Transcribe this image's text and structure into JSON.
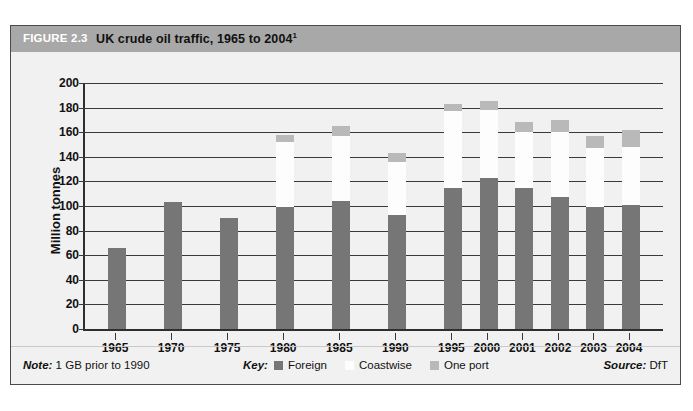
{
  "figure": {
    "number_label": "FIGURE 2.3",
    "title": "UK crude oil traffic, 1965 to 2004",
    "title_superscript": "1"
  },
  "footer": {
    "note_label": "Note:",
    "note_text": "1 GB prior to 1990",
    "key_label": "Key:",
    "source_label": "Source:",
    "source_text": "DfT"
  },
  "colors": {
    "foreign": "#767676",
    "coastwise": "#fdfdfd",
    "one_port": "#b9b9b9",
    "title_bar": "#a8a8a8",
    "panel_background": "#f1f1f1",
    "axis": "#2e2e2e"
  },
  "chart_data": {
    "type": "bar",
    "subtype": "stacked",
    "title": "UK crude oil traffic, 1965 to 2004",
    "xlabel": "",
    "ylabel": "Million tonnes",
    "ylim": [
      0,
      200
    ],
    "yticks": [
      0,
      20,
      40,
      60,
      80,
      100,
      120,
      140,
      160,
      180,
      200
    ],
    "ytick_labels": [
      "0",
      "20",
      "40",
      "60",
      "80",
      "100",
      "120",
      "140",
      "160",
      "180",
      "200"
    ],
    "grid": true,
    "legend_position": "bottom",
    "categories": [
      "1965",
      "1970",
      "1975",
      "1980",
      "1985",
      "1990",
      "1995",
      "2000",
      "2001",
      "2002",
      "2003",
      "2004"
    ],
    "series": [
      {
        "name": "Foreign",
        "color": "#767676",
        "values": [
          66,
          103,
          90,
          99,
          104,
          93,
          115,
          123,
          115,
          107,
          99,
          101
        ]
      },
      {
        "name": "Coastwise",
        "color": "#fdfdfd",
        "values": [
          0,
          0,
          0,
          53,
          53,
          43,
          62,
          55,
          45,
          53,
          48,
          47
        ]
      },
      {
        "name": "One port",
        "color": "#b9b9b9",
        "values": [
          0,
          0,
          0,
          6,
          8,
          7,
          6,
          7,
          8,
          10,
          10,
          14
        ]
      }
    ],
    "totals": [
      66,
      103,
      90,
      158,
      165,
      143,
      183,
      185,
      168,
      170,
      157,
      162
    ]
  }
}
